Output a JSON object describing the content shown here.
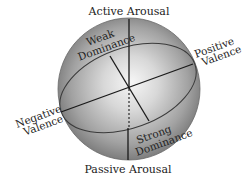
{
  "diagram": {
    "type": "PAD emotion sphere",
    "labels": {
      "top": "Active Arousal",
      "bottom": "Passive Arousal",
      "right_line1": "Positive",
      "right_line2": "Valence",
      "left_line1": "Negative",
      "left_line2": "Valence",
      "upper_left_line1": "Weak",
      "upper_left_line2": "Dominance",
      "lower_right_line1": "Strong",
      "lower_right_line2": "Dominance"
    },
    "axes": [
      {
        "name": "Arousal",
        "positive": "Active Arousal",
        "negative": "Passive Arousal"
      },
      {
        "name": "Valence",
        "positive": "Positive Valence",
        "negative": "Negative Valence"
      },
      {
        "name": "Dominance",
        "positive": "Strong Dominance",
        "negative": "Weak Dominance"
      }
    ],
    "colors": {
      "sphere_light": "#f4f4f4",
      "sphere_dark": "#7a7a7a",
      "line": "#1a1a1a",
      "equator": "#3a3a3a"
    }
  }
}
